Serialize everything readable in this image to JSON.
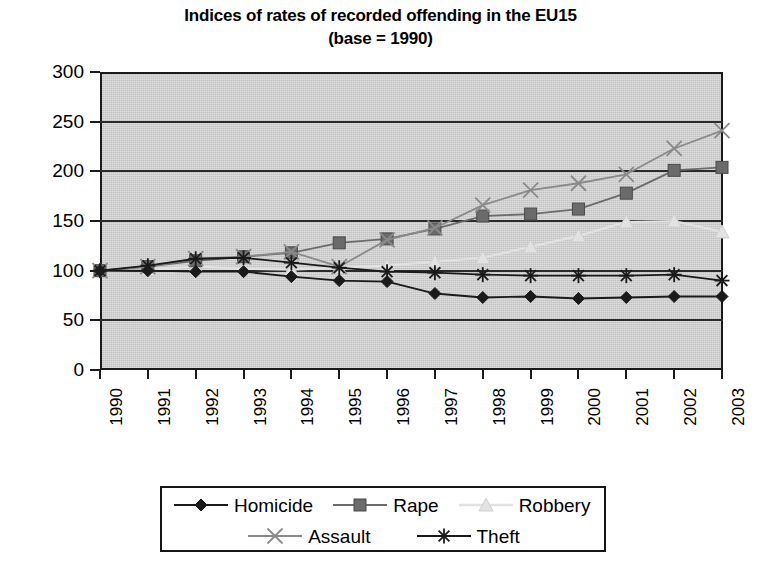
{
  "chart_data": {
    "type": "line",
    "title": "Indices of rates of recorded offending in the EU15 (base = 1990)",
    "title_line1": "Indices of rates of recorded offending in the EU15",
    "title_line2": "(base = 1990)",
    "xlabel": "",
    "ylabel": "",
    "x": [
      "1990",
      "1991",
      "1992",
      "1993",
      "1994",
      "1995",
      "1996",
      "1997",
      "1998",
      "1999",
      "2000",
      "2001",
      "2002",
      "2003"
    ],
    "categories": [
      "1990",
      "1991",
      "1992",
      "1993",
      "1994",
      "1995",
      "1996",
      "1997",
      "1998",
      "1999",
      "2000",
      "2001",
      "2002",
      "2003"
    ],
    "xtick_labels": [
      "1990",
      "1991",
      "1992",
      "1993",
      "1994",
      "1995",
      "1996",
      "1997",
      "1998",
      "1999",
      "2000",
      "2001",
      "2002",
      "2003"
    ],
    "ytick_labels": [
      "0",
      "50",
      "100",
      "150",
      "200",
      "250",
      "300"
    ],
    "ytick_values": [
      0,
      50,
      100,
      150,
      200,
      250,
      300
    ],
    "ylim": [
      0,
      300
    ],
    "grid": true,
    "grid_axis": "y",
    "legend_position": "bottom",
    "plot_background": "#c2c2c2",
    "series": [
      {
        "name": "Homicide",
        "marker": "filled-diamond",
        "color": "#1a1a1a",
        "values": [
          100,
          100,
          99,
          99,
          94,
          90,
          89,
          77,
          73,
          74,
          72,
          73,
          74,
          74
        ]
      },
      {
        "name": "Rape",
        "marker": "filled-square",
        "color": "#6b6b6b",
        "values": [
          100,
          104,
          110,
          114,
          118,
          128,
          132,
          142,
          155,
          157,
          162,
          178,
          201,
          204
        ]
      },
      {
        "name": "Robbery",
        "marker": "filled-triangle",
        "color": "#e2e2e2",
        "values": [
          100,
          101,
          104,
          102,
          101,
          103,
          105,
          109,
          113,
          124,
          135,
          149,
          150,
          139
        ]
      },
      {
        "name": "Assault",
        "marker": "cross-x",
        "color": "#8a8a8a",
        "values": [
          100,
          104,
          112,
          114,
          119,
          104,
          131,
          143,
          166,
          181,
          188,
          197,
          223,
          241
        ]
      },
      {
        "name": "Theft",
        "marker": "asterisk",
        "color": "#1a1a1a",
        "values": [
          100,
          105,
          112,
          113,
          108,
          103,
          99,
          98,
          96,
          95,
          95,
          95,
          96,
          90
        ]
      }
    ]
  },
  "legend": {
    "entries": [
      {
        "label": "Homicide",
        "marker": "filled-diamond",
        "color": "#1a1a1a"
      },
      {
        "label": "Rape",
        "marker": "filled-square",
        "color": "#6b6b6b"
      },
      {
        "label": "Robbery",
        "marker": "filled-triangle",
        "color": "#e2e2e2"
      },
      {
        "label": "Assault",
        "marker": "cross-x",
        "color": "#8a8a8a"
      },
      {
        "label": "Theft",
        "marker": "asterisk",
        "color": "#1a1a1a"
      }
    ]
  }
}
